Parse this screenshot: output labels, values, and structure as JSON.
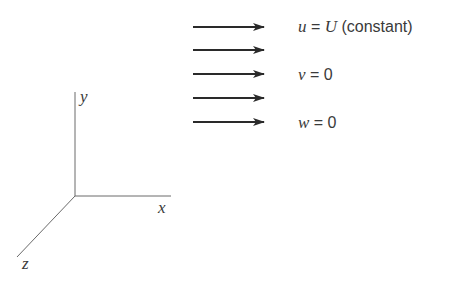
{
  "diagram": {
    "axes": {
      "x_label": "x",
      "y_label": "y",
      "z_label": "z"
    },
    "arrows_count": 5,
    "conditions": [
      {
        "var": "u",
        "eq": " = ",
        "rhs_italic": "U",
        "rhs_plain": " (constant)"
      },
      {
        "var": "v",
        "eq": " = ",
        "rhs_italic": "",
        "rhs_plain": "0"
      },
      {
        "var": "w",
        "eq": " = ",
        "rhs_italic": "",
        "rhs_plain": "0"
      }
    ],
    "colors": {
      "arrow": "#2a2a2a",
      "axis": "#6a6a6a",
      "text": "#3a3a3a"
    }
  }
}
